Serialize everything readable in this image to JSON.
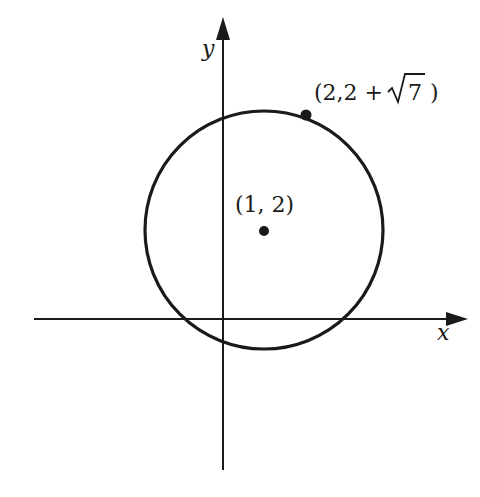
{
  "diagram": {
    "type": "circle-on-coordinate-plane",
    "axes": {
      "x_label": "x",
      "y_label": "y"
    },
    "center": {
      "label": "(1, 2)",
      "coords": [
        1,
        2
      ]
    },
    "point_on_circle": {
      "label_open": "(2,2 + ",
      "label_radicand": "7",
      "label_close": ")",
      "coords_text": "(2, 2 + √7)"
    },
    "circle": {
      "radius_squared": 8,
      "equation": "(x-1)^2 + (y-2)^2 = 8"
    },
    "colors": {
      "stroke": "#1a1a1a",
      "background": "#ffffff"
    }
  }
}
